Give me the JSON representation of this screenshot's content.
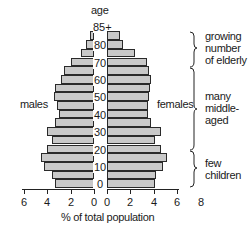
{
  "chart_data": {
    "type": "bar",
    "subtype": "population-pyramid",
    "title": "",
    "xlabel": "% of total population",
    "ylabel": "age",
    "categories": [
      "0-4",
      "5-9",
      "10-14",
      "15-19",
      "20-24",
      "25-29",
      "30-34",
      "35-39",
      "40-44",
      "45-49",
      "50-54",
      "55-59",
      "60-64",
      "65-69",
      "70-74",
      "75-79",
      "80-84",
      "85+"
    ],
    "y_tick_labels": [
      "0",
      "10",
      "20",
      "30",
      "40",
      "50",
      "60",
      "70",
      "80",
      "85+"
    ],
    "series": [
      {
        "name": "males",
        "side": "left",
        "values": [
          3.3,
          3.6,
          4.3,
          4.5,
          4.0,
          3.6,
          4.0,
          3.3,
          3.0,
          3.2,
          3.4,
          3.3,
          2.8,
          2.6,
          2.0,
          1.1,
          0.7,
          0.35
        ]
      },
      {
        "name": "females",
        "side": "right",
        "values": [
          4.1,
          4.2,
          4.8,
          5.1,
          4.6,
          4.1,
          4.6,
          3.8,
          3.5,
          3.5,
          3.6,
          3.7,
          3.8,
          3.6,
          3.4,
          2.4,
          1.4,
          1.1
        ]
      }
    ],
    "x_ticks_left": [
      "6",
      "4",
      "2",
      "0"
    ],
    "x_ticks_right": [
      "0",
      "2",
      "4",
      "6",
      "8"
    ],
    "xlim_left": [
      6,
      0
    ],
    "xlim_right": [
      0,
      8
    ],
    "grid": false,
    "annotations": [
      {
        "text": "growing number of elderly",
        "ages": "70-85+"
      },
      {
        "text": "many middle-aged",
        "ages": "25-69"
      },
      {
        "text": "few children",
        "ages": "0-24"
      }
    ]
  },
  "labels": {
    "age": "age",
    "males": "males",
    "females": "females",
    "xlabel": "% of total population"
  },
  "annotations": {
    "elderly": [
      "growing",
      "number",
      "of elderly"
    ],
    "middle": [
      "many",
      "middle-",
      "aged"
    ],
    "children": [
      "few",
      "children"
    ]
  }
}
